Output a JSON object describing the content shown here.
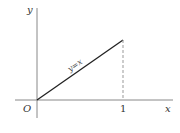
{
  "figure": {
    "axes": {
      "x_label": "x",
      "y_label": "y",
      "origin_label": "O",
      "x_tick_label": "1"
    },
    "line": {
      "equation": "y=x",
      "from": [
        0,
        0
      ],
      "to": [
        1,
        1
      ]
    },
    "dashed_line": {
      "x": 1,
      "from_y": 0,
      "to_y": 1
    },
    "colors": {
      "axis": "#888888",
      "line": "#222222",
      "dashed": "#999999"
    }
  }
}
